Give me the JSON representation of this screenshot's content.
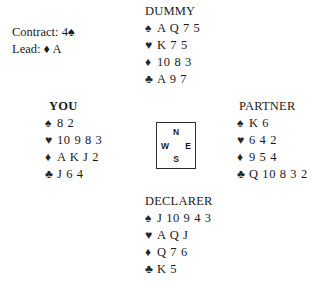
{
  "suits": {
    "spade": "♠",
    "heart": "♥",
    "diamond": "♦",
    "club": "♣"
  },
  "contract": {
    "contract_line": "Contract: 4♠",
    "lead_line": "Lead: ♦ A"
  },
  "compass": {
    "north": "N",
    "west": "W",
    "east": "E",
    "south": "S"
  },
  "hands": {
    "dummy": {
      "label": "DUMMY",
      "spades": "A Q 7 5",
      "hearts": "K 7 5",
      "diamonds": "10 8 3",
      "clubs": "A 9 7"
    },
    "you": {
      "label": "YOU",
      "spades": "8 2",
      "hearts": "10 9 8 3",
      "diamonds": "A K J 2",
      "clubs": "J 6 4"
    },
    "partner": {
      "label": "PARTNER",
      "spades": "K 6",
      "hearts": "6 4 2",
      "diamonds": "9 5 4",
      "clubs": "Q 10 8 3 2"
    },
    "declarer": {
      "label": "DECLARER",
      "spades": "J 10 9 4 3",
      "hearts": "A Q J",
      "diamonds": "Q 7 6",
      "clubs": "K 5"
    }
  }
}
